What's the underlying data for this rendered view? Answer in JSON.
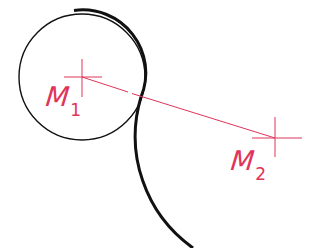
{
  "diagram": {
    "type": "geometric-construction",
    "colors": {
      "background": "#ffffff",
      "construction": "#e0345a",
      "outline": "#111111"
    },
    "points": {
      "m1": {
        "x": 82,
        "y": 77,
        "radius": 63
      },
      "m2": {
        "x": 275,
        "y": 138,
        "radius": 137
      }
    },
    "labels": {
      "m1": {
        "main": "M",
        "sub": "1"
      },
      "m2": {
        "main": "M",
        "sub": "2"
      }
    }
  }
}
